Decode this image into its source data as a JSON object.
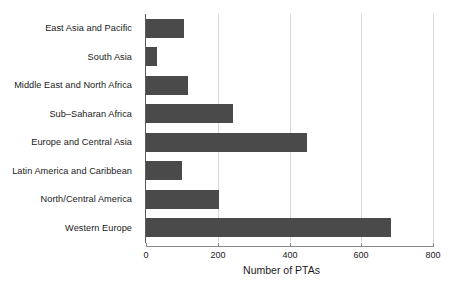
{
  "chart_data": {
    "type": "bar",
    "orientation": "horizontal",
    "title": "",
    "xlabel": "Number of PTAs",
    "ylabel": "",
    "xlim": [
      0,
      800
    ],
    "xticks": [
      0,
      200,
      400,
      600,
      800
    ],
    "xtick_labels": [
      "0",
      "200",
      "400",
      "600",
      "800"
    ],
    "grid": "vertical-only",
    "legend": "none",
    "categories": [
      "East Asia and Pacific",
      "South Asia",
      "Middle East and North Africa",
      "Sub–Saharan Africa",
      "Europe and Central Asia",
      "Latin America and Caribbean",
      "North/Central America",
      "Western Europe"
    ],
    "values": [
      106,
      31,
      117,
      243,
      449,
      100,
      203,
      683
    ],
    "bar_color": "#4a4a4a",
    "grid_color": "#d9d9d9",
    "axis_color": "#8a8a8a",
    "background_color": "#ffffff"
  }
}
